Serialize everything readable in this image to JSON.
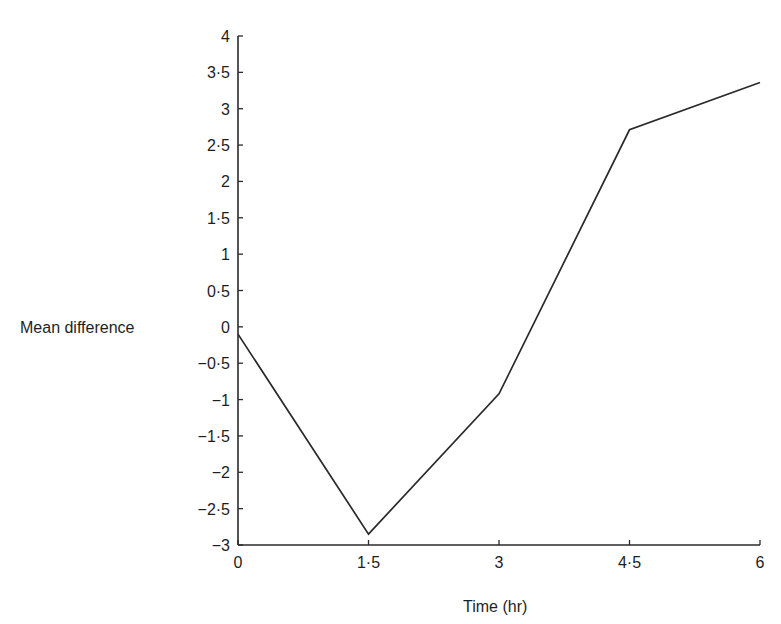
{
  "chart_data": {
    "type": "line",
    "title": "",
    "xlabel": "Time (hr)",
    "ylabel": "Mean difference",
    "x": [
      0,
      1.5,
      3,
      4.5,
      6
    ],
    "series": [
      {
        "name": "Mean difference",
        "values": [
          -0.1,
          -2.85,
          -0.92,
          2.71,
          3.36
        ],
        "color": "#2a2a2a"
      }
    ],
    "xlim": [
      0,
      6
    ],
    "ylim": [
      -3,
      4
    ],
    "x_ticks": [
      0,
      1.5,
      3,
      4.5,
      6
    ],
    "x_tick_labels": [
      "0",
      "1·5",
      "3",
      "4·5",
      "6"
    ],
    "y_ticks": [
      4,
      3.5,
      3,
      2.5,
      2,
      1.5,
      1,
      0.5,
      0,
      -0.5,
      -1,
      -1.5,
      -2,
      -2.5,
      -3
    ],
    "y_tick_labels": [
      "4",
      "3·5",
      "3",
      "2·5",
      "2",
      "1·5",
      "1",
      "0·5",
      "0",
      "−0·5",
      "−1",
      "−1·5",
      "−2",
      "−2·5",
      "−3"
    ],
    "grid": false,
    "legend": "none"
  },
  "labels": {
    "x_axis_title": "Time (hr)",
    "y_axis_title": "Mean difference"
  }
}
